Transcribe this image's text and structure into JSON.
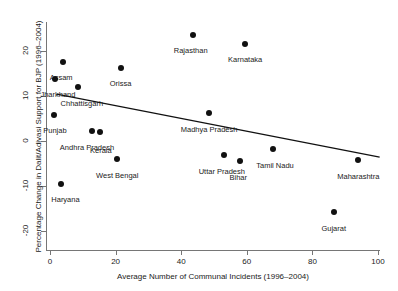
{
  "chart_data": {
    "type": "scatter",
    "title": "",
    "xlabel": "Average Number of Communal Incidents (1996–2004)",
    "ylabel": "Percentage Change in Dalit/Adivasi Support for BJP (1996–2004)",
    "xlim": [
      -2,
      103
    ],
    "ylim": [
      -22,
      25
    ],
    "xticks": [
      0,
      20,
      40,
      60,
      80,
      100
    ],
    "xtick_labels": [
      "0",
      "20",
      "40",
      "60",
      "80",
      "100"
    ],
    "yticks": [
      -20,
      -10,
      0,
      10,
      20
    ],
    "ytick_labels": [
      "-20",
      "-10",
      "0",
      "10",
      "20"
    ],
    "grid": false,
    "legend": "none",
    "points": [
      {
        "label": "Rajasthan",
        "x": 43.5,
        "y": 23.5,
        "label_dx": -2,
        "label_dy": 11
      },
      {
        "label": "Karnataka",
        "x": 59.5,
        "y": 21.5,
        "label_dx": 0,
        "label_dy": 11
      },
      {
        "label": "Assam",
        "x": 4.0,
        "y": 17.5,
        "label_dx": -2,
        "label_dy": 11
      },
      {
        "label": "Orissa",
        "x": 21.5,
        "y": 16.3,
        "label_dx": 0,
        "label_dy": 11
      },
      {
        "label": "Jharkhand",
        "x": 1.5,
        "y": 13.8,
        "label_dx": 3,
        "label_dy": 11
      },
      {
        "label": "Chhattisgarh",
        "x": 8.5,
        "y": 12.0,
        "label_dx": 4,
        "label_dy": 12
      },
      {
        "label": "Punjab",
        "x": 1.2,
        "y": 5.8,
        "label_dx": 1,
        "label_dy": 11
      },
      {
        "label": "Madhya Pradesh",
        "x": 48.5,
        "y": 6.2,
        "label_dx": 0,
        "label_dy": 12
      },
      {
        "label": "Andhra Pradesh",
        "x": 12.8,
        "y": 2.2,
        "label_dx": -5,
        "label_dy": 12
      },
      {
        "label": "Kerala",
        "x": 15.2,
        "y": 2.0,
        "label_dx": 1,
        "label_dy": 14
      },
      {
        "label": "Tamil Nadu",
        "x": 68.0,
        "y": -1.8,
        "label_dx": 2,
        "label_dy": 12
      },
      {
        "label": "West Bengal",
        "x": 20.5,
        "y": -4.0,
        "label_dx": 0,
        "label_dy": 12
      },
      {
        "label": "Uttar Pradesh",
        "x": 53.0,
        "y": -3.0,
        "label_dx": -2,
        "label_dy": 12
      },
      {
        "label": "Bihar",
        "x": 58.0,
        "y": -4.5,
        "label_dx": -2,
        "label_dy": 12
      },
      {
        "label": "Maharashtra",
        "x": 94.0,
        "y": -4.3,
        "label_dx": 0,
        "label_dy": 12
      },
      {
        "label": "Haryana",
        "x": 3.5,
        "y": -9.5,
        "label_dx": 4,
        "label_dy": 11
      },
      {
        "label": "Gujarat",
        "x": 86.5,
        "y": -15.8,
        "label_dx": 0,
        "label_dy": 12
      }
    ],
    "fit_line": {
      "x1": 2.0,
      "y1": 10.4,
      "x2": 100.5,
      "y2": -3.6,
      "color": "#111111"
    }
  },
  "colors": {
    "point": "#111111",
    "axis": "#767676",
    "text": "#1a1a1a",
    "background": "#ffffff"
  }
}
